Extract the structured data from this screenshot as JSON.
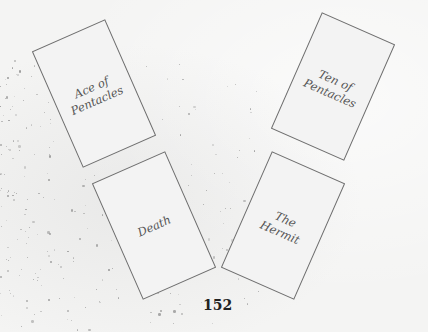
{
  "cards": [
    {
      "label": "Ace of\nPentacles",
      "cx": 93.5,
      "cy": 93,
      "rotate": -23.7
    },
    {
      "label": "Ten of\nPentacles",
      "cx": 332.5,
      "cy": 86,
      "rotate": 23.7
    },
    {
      "label": "Death",
      "cx": 153.5,
      "cy": 225,
      "rotate": -23.7
    },
    {
      "label": "The\nHermit",
      "cx": 283,
      "cy": 225,
      "rotate": 23.7
    }
  ],
  "page": {
    "number": "152"
  }
}
